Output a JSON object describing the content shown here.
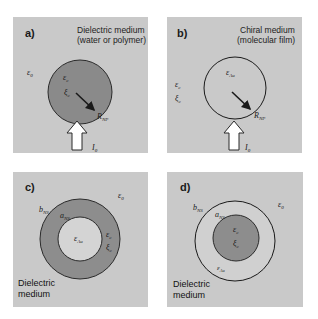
{
  "colors": {
    "panel_bg": "#c9c9c9",
    "metal": "#8a8a8a",
    "shell_dark": "#8d8d8d",
    "cavity": "#d4d4d4",
    "stroke": "#2a2a2a",
    "arrow_fill": "#ffffff"
  },
  "panels": [
    {
      "id": "a",
      "letter": "a)",
      "title_line1": "Dielectric medium",
      "title_line2": "(water or polymer)",
      "outside_eps": "ε",
      "outside_eps_sub": "0",
      "inside_eps": "ε",
      "inside_eps_sub": "c",
      "inside_xi": "ξ",
      "inside_xi_sub": "c",
      "radius_label": "R",
      "radius_label_sub": "NP",
      "light_label": "I",
      "light_label_sub": "0"
    },
    {
      "id": "b",
      "letter": "b)",
      "title_line1": "Chiral medium",
      "title_line2": "(molecular film)",
      "outside_eps": "ε",
      "outside_eps_sub": "c",
      "outside_xi": "ξ",
      "outside_xi_sub": "c",
      "inside_eps": "ε",
      "inside_eps_sub": "Au",
      "radius_label": "R",
      "radius_label_sub": "NP",
      "light_label": "I",
      "light_label_sub": "0"
    },
    {
      "id": "c",
      "letter": "c)",
      "outside_eps": "ε",
      "outside_eps_sub": "0",
      "outer_radius": "b",
      "outer_radius_sub": "NS",
      "inner_radius": "a",
      "inner_radius_sub": "NS",
      "core_eps": "ε",
      "core_eps_sub": "Au",
      "shell_eps": "ε",
      "shell_eps_sub": "c",
      "shell_xi": "ξ",
      "shell_xi_sub": "c",
      "medium_line1": "Dielectric",
      "medium_line2": "medium"
    },
    {
      "id": "d",
      "letter": "d)",
      "outside_eps": "ε",
      "outside_eps_sub": "0",
      "outer_radius": "b",
      "outer_radius_sub": "NS",
      "inner_radius": "a",
      "inner_radius_sub": "NS",
      "core_eps": "ε",
      "core_eps_sub": "c",
      "core_xi": "ξ",
      "core_xi_sub": "c",
      "shell_eps": "ε",
      "shell_eps_sub": "Au",
      "medium_line1": "Dielectric",
      "medium_line2": "medium"
    }
  ]
}
